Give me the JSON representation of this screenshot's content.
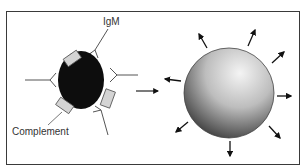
{
  "diagram": {
    "labels": {
      "igm": "IgM",
      "complement": "Complement"
    },
    "left_panel": {
      "cell": "bacterium-bound-by-igm-and-complement",
      "cell_color": "#111111",
      "complement_color": "#d4d4d4"
    },
    "transition_arrow": "right-arrow",
    "right_panel": {
      "cell": "lysed-swelling-cell",
      "gradient_light": "#f2f2f2",
      "gradient_dark": "#2a2a2a",
      "arrow_count": 9
    },
    "border_color": "#3a3a3a"
  }
}
